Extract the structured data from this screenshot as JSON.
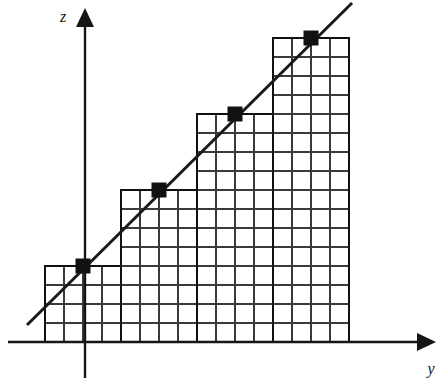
{
  "figure": {
    "axes": {
      "vertical": {
        "label": "z",
        "label_x": 63,
        "label_y": 22,
        "x": 85,
        "y_top": 8,
        "y_bottom": 378,
        "arrow": "up-arrow-icon"
      },
      "horizontal": {
        "label": "y",
        "label_x": 431,
        "label_y": 374,
        "y": 342,
        "x_left": 8,
        "x_right": 436,
        "arrow": "right-arrow-icon"
      }
    },
    "grid": {
      "cell_width": 19,
      "cell_height": 19,
      "origin_x": 45,
      "baseline_y": 342,
      "columns_per_bar": 4
    },
    "line": {
      "color": "#1a1a1a",
      "width": 3,
      "x1": 27,
      "y1": 325,
      "x2": 352,
      "y2": 3
    },
    "marker": {
      "shape": "square",
      "color": "#111111",
      "size": 15
    }
  },
  "chart_data": {
    "type": "bar",
    "title": "",
    "xlabel": "y",
    "ylabel": "z",
    "grid": true,
    "legend": null,
    "categories": [
      "1",
      "2",
      "3",
      "4"
    ],
    "values": [
      4,
      8,
      12,
      16
    ],
    "unit_cells_wide": 4,
    "xlim": [
      0,
      16
    ],
    "ylim": [
      0,
      16
    ],
    "bars": [
      {
        "index": 1,
        "x_left": 45,
        "x_right": 121,
        "top_y": 266,
        "cols": 4,
        "rows": 4,
        "height_units": 4
      },
      {
        "index": 2,
        "x_left": 121,
        "x_right": 197,
        "top_y": 190,
        "cols": 4,
        "rows": 8,
        "height_units": 8
      },
      {
        "index": 3,
        "x_left": 197,
        "x_right": 273,
        "top_y": 114,
        "cols": 4,
        "rows": 12,
        "height_units": 12
      },
      {
        "index": 4,
        "x_left": 273,
        "x_right": 349,
        "top_y": 38,
        "cols": 4,
        "rows": 16,
        "height_units": 16
      }
    ],
    "markers": [
      {
        "x": 83,
        "y": 266,
        "value_x": 2,
        "value_y": 4
      },
      {
        "x": 159,
        "y": 190,
        "value_x": 6,
        "value_y": 8
      },
      {
        "x": 235,
        "y": 114,
        "value_x": 10,
        "value_y": 12
      },
      {
        "x": 311,
        "y": 38,
        "value_x": 14,
        "value_y": 16
      }
    ],
    "series": [
      {
        "name": "step-approximation",
        "values": [
          4,
          8,
          12,
          16
        ]
      },
      {
        "name": "linear-reference-line",
        "values": [
          4,
          8,
          12,
          16
        ]
      }
    ]
  }
}
